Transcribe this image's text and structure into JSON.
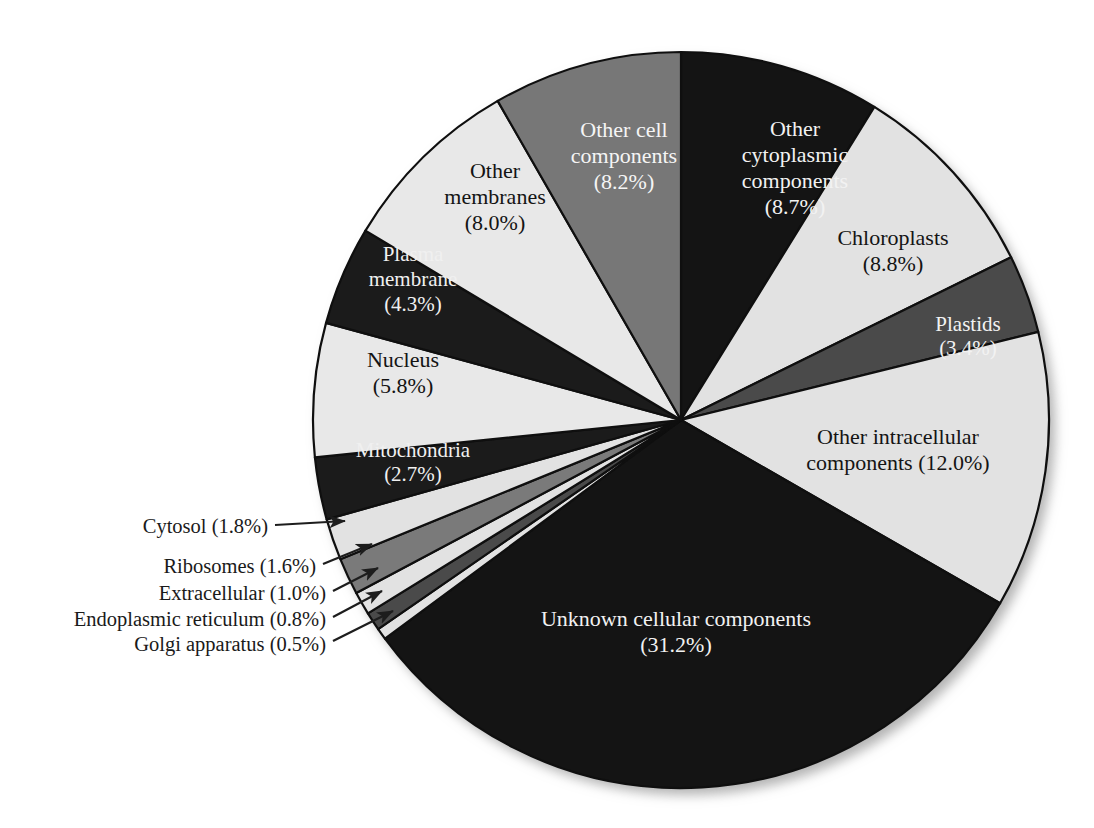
{
  "chart_data": {
    "type": "pie",
    "title": "",
    "subtitle": "",
    "xlabel": "",
    "ylabel": "",
    "legend_position": "none",
    "grid": false,
    "start_angle_deg": 0,
    "direction": "clockwise",
    "unit": "%",
    "categories": [
      "Other cytoplasmic components",
      "Chloroplasts",
      "Plastids",
      "Other intracellular components",
      "Unknown cellular components",
      "Golgi apparatus",
      "Endoplasmic reticulum",
      "Extracellular",
      "Ribosomes",
      "Cytosol",
      "Mitochondria",
      "Nucleus",
      "Plasma membrane",
      "Other membranes",
      "Other cell components"
    ],
    "values": [
      8.7,
      8.8,
      3.4,
      12.0,
      31.2,
      0.5,
      0.8,
      1.0,
      1.6,
      1.8,
      2.7,
      5.8,
      4.3,
      8.0,
      8.2
    ],
    "slices": [
      {
        "name": "Other cytoplasmic components",
        "label": "Other\ncytoplasmic\ncomponents\n(8.7%)",
        "label_lines": [
          "Other",
          "cytoplasmic",
          "components",
          "(8.7%)"
        ],
        "value": 8.7,
        "percent_text": "(8.7%)",
        "color": "#141414",
        "text_color": "#f2f2f2",
        "label_mode": "inside",
        "label_x": 795,
        "label_y": 170,
        "font_size": 22
      },
      {
        "name": "Chloroplasts",
        "label": "Chloroplasts\n(8.8%)",
        "label_lines": [
          "Chloroplasts",
          "(8.8%)"
        ],
        "value": 8.8,
        "percent_text": "(8.8%)",
        "color": "#e2e2e2",
        "text_color": "#141414",
        "label_mode": "inside",
        "label_x": 893,
        "label_y": 253,
        "font_size": 22
      },
      {
        "name": "Plastids",
        "label": "Plastids\n(3.4%)",
        "label_lines": [
          "Plastids",
          "(3.4%)"
        ],
        "value": 3.4,
        "percent_text": "(3.4%)",
        "color": "#4a4a4a",
        "text_color": "#f2f2f2",
        "label_mode": "inside",
        "label_x": 968,
        "label_y": 338,
        "font_size": 21
      },
      {
        "name": "Other intracellular components",
        "label": "Other intracellular\ncomponents (12.0%)",
        "label_lines": [
          "Other intracellular",
          "components (12.0%)"
        ],
        "value": 12.0,
        "percent_text": "(12.0%)",
        "color": "#e2e2e2",
        "text_color": "#141414",
        "label_mode": "inside",
        "label_x": 898,
        "label_y": 452,
        "font_size": 22
      },
      {
        "name": "Unknown cellular components",
        "label": "Unknown cellular components\n(31.2%)",
        "label_lines": [
          "Unknown cellular components",
          "(31.2%)"
        ],
        "value": 31.2,
        "percent_text": "(31.2%)",
        "color": "#141414",
        "text_color": "#f2f2f2",
        "label_mode": "inside",
        "label_x": 676,
        "label_y": 634,
        "font_size": 22
      },
      {
        "name": "Golgi apparatus",
        "label": "Golgi apparatus (0.5%)",
        "label_lines": [
          "Golgi apparatus (0.5%)"
        ],
        "value": 0.5,
        "percent_text": "(0.5%)",
        "color": "#e2e2e2",
        "text_color": "#1a1a1a",
        "label_mode": "callout",
        "label_x": 326,
        "label_y": 646,
        "arrow_from_x": 333,
        "arrow_from_y": 641,
        "arrow_to_x": 393,
        "arrow_to_y": 611,
        "font_size": 20.5
      },
      {
        "name": "Endoplasmic reticulum",
        "label": "Endoplasmic reticulum (0.8%)",
        "label_lines": [
          "Endoplasmic reticulum (0.8%)"
        ],
        "value": 0.8,
        "percent_text": "(0.8%)",
        "color": "#4a4a4a",
        "text_color": "#1a1a1a",
        "label_mode": "callout",
        "label_x": 326,
        "label_y": 621,
        "arrow_from_x": 333,
        "arrow_from_y": 617,
        "arrow_to_x": 382,
        "arrow_to_y": 591,
        "font_size": 20.5
      },
      {
        "name": "Extracellular",
        "label": "Extracellular (1.0%)",
        "label_lines": [
          "Extracellular (1.0%)"
        ],
        "value": 1.0,
        "percent_text": "(1.0%)",
        "color": "#e2e2e2",
        "text_color": "#1a1a1a",
        "label_mode": "callout",
        "label_x": 326,
        "label_y": 595,
        "arrow_from_x": 333,
        "arrow_from_y": 591,
        "arrow_to_x": 378,
        "arrow_to_y": 568,
        "font_size": 20.5
      },
      {
        "name": "Ribosomes",
        "label": "Ribosomes (1.6%)",
        "label_lines": [
          "Ribosomes (1.6%)"
        ],
        "value": 1.6,
        "percent_text": "(1.6%)",
        "color": "#7a7a7a",
        "text_color": "#1a1a1a",
        "label_mode": "callout",
        "label_x": 316,
        "label_y": 568,
        "arrow_from_x": 323,
        "arrow_from_y": 564,
        "arrow_to_x": 372,
        "arrow_to_y": 544,
        "font_size": 20.5
      },
      {
        "name": "Cytosol",
        "label": "Cytosol (1.8%)",
        "label_lines": [
          "Cytosol (1.8%)"
        ],
        "value": 1.8,
        "percent_text": "(1.8%)",
        "color": "#e2e2e2",
        "text_color": "#1a1a1a",
        "label_mode": "callout",
        "label_x": 268,
        "label_y": 528,
        "arrow_from_x": 275,
        "arrow_from_y": 525,
        "arrow_to_x": 345,
        "arrow_to_y": 521,
        "font_size": 20.5
      },
      {
        "name": "Mitochondria",
        "label": "Mitochondria\n(2.7%)",
        "label_lines": [
          "Mitochondria",
          "(2.7%)"
        ],
        "value": 2.7,
        "percent_text": "(2.7%)",
        "color": "#1b1b1b",
        "text_color": "#f0f0f0",
        "label_mode": "inside",
        "label_x": 413,
        "label_y": 464,
        "font_size": 21
      },
      {
        "name": "Nucleus",
        "label": "Nucleus\n(5.8%)",
        "label_lines": [
          "Nucleus",
          "(5.8%)"
        ],
        "value": 5.8,
        "percent_text": "(5.8%)",
        "color": "#e8e8e8",
        "text_color": "#141414",
        "label_mode": "inside",
        "label_x": 403,
        "label_y": 375,
        "font_size": 22
      },
      {
        "name": "Plasma membrane",
        "label": "Plasma\nmembrane\n(4.3%)",
        "label_lines": [
          "Plasma",
          "membrane",
          "(4.3%)"
        ],
        "value": 4.3,
        "percent_text": "(4.3%)",
        "color": "#1b1b1b",
        "text_color": "#f0f0f0",
        "label_mode": "inside",
        "label_x": 413,
        "label_y": 281,
        "font_size": 21
      },
      {
        "name": "Other membranes",
        "label": "Other\nmembranes\n(8.0%)",
        "label_lines": [
          "Other",
          "membranes",
          "(8.0%)"
        ],
        "value": 8.0,
        "percent_text": "(8.0%)",
        "color": "#e8e8e8",
        "text_color": "#141414",
        "label_mode": "inside",
        "label_x": 495,
        "label_y": 199,
        "font_size": 22
      },
      {
        "name": "Other cell components",
        "label": "Other cell\ncomponents\n(8.2%)",
        "label_lines": [
          "Other cell",
          "components",
          "(8.2%)"
        ],
        "value": 8.2,
        "percent_text": "(8.2%)",
        "color": "#777777",
        "text_color": "#f5f5f5",
        "label_mode": "inside",
        "label_x": 624,
        "label_y": 158,
        "font_size": 22
      }
    ],
    "geometry": {
      "center_x": 681,
      "center_y": 420,
      "radius": 368,
      "stroke_color": "#0f0f0f",
      "stroke_width": 2.2
    }
  }
}
